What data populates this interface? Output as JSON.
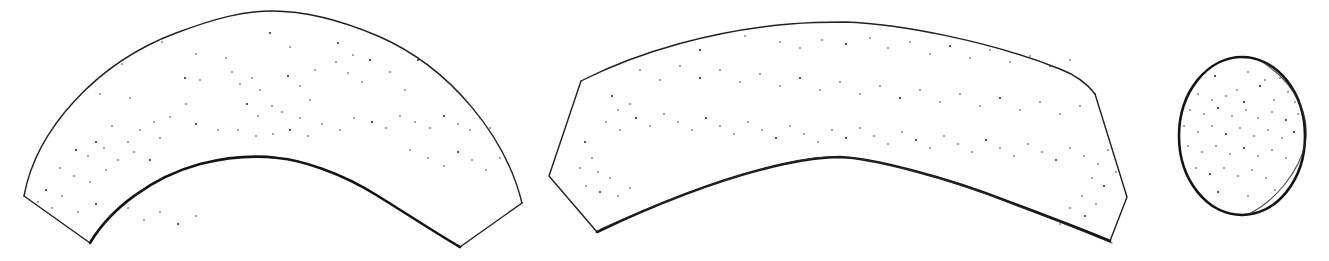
{
  "figure": {
    "background_color": "#ffffff",
    "outline_color": "#1f1f1f",
    "heavy_outline_color": "#141414",
    "dot_color": "#4a4a4a",
    "canvas": {
      "width": 1329,
      "height": 261
    },
    "shape_count": 3
  },
  "shapes": [
    {
      "id": "crescent-left",
      "label": "Left curved band",
      "kind": "crescent-band",
      "bbox": {
        "x": 22,
        "y": 8,
        "width": 502,
        "height": 242
      },
      "outer_arc_apex": {
        "x": 272,
        "y": 11
      },
      "inner_arc_apex": {
        "x": 278,
        "y": 158
      },
      "corners": [
        {
          "x": 24,
          "y": 196
        },
        {
          "x": 90,
          "y": 243
        },
        {
          "x": 460,
          "y": 247
        },
        {
          "x": 522,
          "y": 203
        }
      ],
      "outer_path": "M24,196 C36,130 96,63 176,33 C216,18 244,11 272,11 C302,11 338,19 378,36 C452,68 506,138 522,203",
      "inner_path": "M90,243 C110,209 152,177 200,164 C236,155 262,156 278,158 C300,160 340,172 378,196 C418,221 444,238 460,247",
      "end_cap_left": "M24,196 L90,243",
      "end_cap_right": "M460,247 L522,203",
      "dot_count": 88
    },
    {
      "id": "crescent-right",
      "label": "Right curved band",
      "kind": "crescent-band",
      "bbox": {
        "x": 548,
        "y": 20,
        "width": 580,
        "height": 224
      },
      "outer_arc_apex": {
        "x": 845,
        "y": 22
      },
      "inner_arc_apex": {
        "x": 840,
        "y": 157
      },
      "corners": [
        {
          "x": 581,
          "y": 81
        },
        {
          "x": 549,
          "y": 176
        },
        {
          "x": 597,
          "y": 232
        },
        {
          "x": 1110,
          "y": 241
        },
        {
          "x": 1127,
          "y": 197
        },
        {
          "x": 1095,
          "y": 94
        }
      ],
      "outer_path": "M581,81 C640,51 716,30 790,24 C812,22 832,22 845,22 C902,24 992,42 1060,69 C1078,76 1089,86 1095,94",
      "inner_path": "M597,232 C654,205 720,178 784,164 C812,158 830,157 840,157 C870,158 944,176 1012,203 C1060,221 1098,236 1110,241",
      "inner_path_ghost": "M601,229 C658,203 724,177 788,163 C816,157 834,156 844,157 C874,159 948,178 1016,205 C1064,223 1100,238 1112,243",
      "end_cap_left": "M581,81 L549,176 L597,232",
      "end_cap_right": "M1095,94 L1127,197 L1110,241",
      "dot_count": 96
    },
    {
      "id": "circle-right",
      "label": "Circle",
      "kind": "circle",
      "bbox": {
        "x": 1179,
        "y": 57,
        "width": 128,
        "height": 158
      },
      "center": {
        "x": 1242,
        "y": 136
      },
      "radius_x": 63,
      "radius_y": 79,
      "has_double_stroke_right": true,
      "dot_count": 45
    }
  ],
  "stipple": {
    "crescent_left": [
      [
        270,
        33
      ],
      [
        162,
        42
      ],
      [
        196,
        54
      ],
      [
        226,
        58
      ],
      [
        290,
        47
      ],
      [
        338,
        43
      ],
      [
        315,
        70
      ],
      [
        122,
        64
      ],
      [
        100,
        94
      ],
      [
        130,
        98
      ],
      [
        185,
        78
      ],
      [
        200,
        80
      ],
      [
        232,
        72
      ],
      [
        240,
        84
      ],
      [
        252,
        78
      ],
      [
        288,
        76
      ],
      [
        260,
        90
      ],
      [
        300,
        86
      ],
      [
        336,
        62
      ],
      [
        353,
        55
      ],
      [
        370,
        60
      ],
      [
        348,
        73
      ],
      [
        362,
        82
      ],
      [
        390,
        72
      ],
      [
        405,
        90
      ],
      [
        418,
        60
      ],
      [
        310,
        100
      ],
      [
        272,
        106
      ],
      [
        282,
        112
      ],
      [
        300,
        118
      ],
      [
        247,
        104
      ],
      [
        258,
        116
      ],
      [
        186,
        104
      ],
      [
        170,
        117
      ],
      [
        154,
        122
      ],
      [
        196,
        124
      ],
      [
        140,
        130
      ],
      [
        160,
        138
      ],
      [
        112,
        126
      ],
      [
        128,
        142
      ],
      [
        96,
        142
      ],
      [
        218,
        130
      ],
      [
        238,
        130
      ],
      [
        256,
        136
      ],
      [
        273,
        134
      ],
      [
        290,
        130
      ],
      [
        308,
        136
      ],
      [
        322,
        124
      ],
      [
        340,
        130
      ],
      [
        354,
        118
      ],
      [
        372,
        122
      ],
      [
        386,
        128
      ],
      [
        400,
        116
      ],
      [
        415,
        122
      ],
      [
        430,
        128
      ],
      [
        444,
        116
      ],
      [
        458,
        124
      ],
      [
        470,
        130
      ],
      [
        480,
        118
      ],
      [
        490,
        128
      ],
      [
        76,
        150
      ],
      [
        88,
        156
      ],
      [
        104,
        148
      ],
      [
        118,
        160
      ],
      [
        134,
        152
      ],
      [
        150,
        160
      ],
      [
        60,
        168
      ],
      [
        74,
        176
      ],
      [
        90,
        182
      ],
      [
        106,
        170
      ],
      [
        46,
        190
      ],
      [
        62,
        196
      ],
      [
        38,
        202
      ],
      [
        52,
        208
      ],
      [
        78,
        212
      ],
      [
        96,
        204
      ],
      [
        110,
        216
      ],
      [
        128,
        208
      ],
      [
        144,
        220
      ],
      [
        160,
        212
      ],
      [
        178,
        224
      ],
      [
        196,
        216
      ],
      [
        410,
        150
      ],
      [
        428,
        158
      ],
      [
        444,
        166
      ],
      [
        458,
        152
      ],
      [
        472,
        160
      ],
      [
        486,
        170
      ],
      [
        500,
        158
      ]
    ],
    "crescent_right": [
      [
        700,
        50
      ],
      [
        745,
        36
      ],
      [
        780,
        42
      ],
      [
        800,
        48
      ],
      [
        822,
        40
      ],
      [
        846,
        44
      ],
      [
        870,
        38
      ],
      [
        888,
        48
      ],
      [
        910,
        42
      ],
      [
        930,
        54
      ],
      [
        950,
        46
      ],
      [
        970,
        58
      ],
      [
        990,
        50
      ],
      [
        1010,
        62
      ],
      [
        1030,
        56
      ],
      [
        1050,
        66
      ],
      [
        1070,
        60
      ],
      [
        640,
        70
      ],
      [
        660,
        80
      ],
      [
        680,
        66
      ],
      [
        700,
        78
      ],
      [
        720,
        70
      ],
      [
        740,
        82
      ],
      [
        760,
        74
      ],
      [
        780,
        86
      ],
      [
        800,
        78
      ],
      [
        820,
        90
      ],
      [
        840,
        82
      ],
      [
        860,
        94
      ],
      [
        880,
        86
      ],
      [
        900,
        98
      ],
      [
        920,
        90
      ],
      [
        940,
        102
      ],
      [
        960,
        94
      ],
      [
        980,
        106
      ],
      [
        1000,
        98
      ],
      [
        1020,
        110
      ],
      [
        1040,
        102
      ],
      [
        1060,
        114
      ],
      [
        1080,
        106
      ],
      [
        612,
        96
      ],
      [
        618,
        110
      ],
      [
        630,
        104
      ],
      [
        606,
        122
      ],
      [
        620,
        130
      ],
      [
        636,
        118
      ],
      [
        650,
        126
      ],
      [
        664,
        114
      ],
      [
        678,
        122
      ],
      [
        692,
        130
      ],
      [
        706,
        118
      ],
      [
        720,
        126
      ],
      [
        734,
        134
      ],
      [
        748,
        122
      ],
      [
        762,
        130
      ],
      [
        776,
        138
      ],
      [
        790,
        126
      ],
      [
        804,
        134
      ],
      [
        818,
        142
      ],
      [
        832,
        130
      ],
      [
        846,
        138
      ],
      [
        860,
        128
      ],
      [
        874,
        136
      ],
      [
        888,
        144
      ],
      [
        902,
        132
      ],
      [
        916,
        140
      ],
      [
        930,
        148
      ],
      [
        944,
        136
      ],
      [
        958,
        144
      ],
      [
        972,
        152
      ],
      [
        986,
        140
      ],
      [
        1000,
        148
      ],
      [
        1014,
        156
      ],
      [
        1028,
        144
      ],
      [
        1042,
        152
      ],
      [
        1056,
        160
      ],
      [
        1070,
        148
      ],
      [
        1084,
        156
      ],
      [
        1098,
        164
      ],
      [
        1108,
        150
      ],
      [
        585,
        142
      ],
      [
        592,
        158
      ],
      [
        580,
        168
      ],
      [
        598,
        172
      ],
      [
        586,
        186
      ],
      [
        600,
        192
      ],
      [
        610,
        178
      ],
      [
        618,
        196
      ],
      [
        630,
        188
      ],
      [
        1092,
        178
      ],
      [
        1104,
        186
      ],
      [
        1116,
        172
      ],
      [
        1082,
        196
      ],
      [
        1096,
        204
      ],
      [
        1070,
        208
      ],
      [
        1085,
        216
      ],
      [
        1060,
        224
      ]
    ],
    "circle": [
      [
        1215,
        76
      ],
      [
        1248,
        72
      ],
      [
        1265,
        80
      ],
      [
        1280,
        78
      ],
      [
        1237,
        90
      ],
      [
        1260,
        86
      ],
      [
        1288,
        92
      ],
      [
        1198,
        94
      ],
      [
        1212,
        100
      ],
      [
        1226,
        96
      ],
      [
        1244,
        102
      ],
      [
        1274,
        100
      ],
      [
        1295,
        102
      ],
      [
        1190,
        110
      ],
      [
        1204,
        114
      ],
      [
        1218,
        108
      ],
      [
        1232,
        116
      ],
      [
        1246,
        110
      ],
      [
        1258,
        118
      ],
      [
        1272,
        112
      ],
      [
        1286,
        120
      ],
      [
        1298,
        114
      ],
      [
        1184,
        126
      ],
      [
        1198,
        132
      ],
      [
        1212,
        126
      ],
      [
        1226,
        134
      ],
      [
        1240,
        128
      ],
      [
        1254,
        136
      ],
      [
        1268,
        130
      ],
      [
        1282,
        138
      ],
      [
        1294,
        132
      ],
      [
        1188,
        146
      ],
      [
        1202,
        152
      ],
      [
        1216,
        146
      ],
      [
        1230,
        154
      ],
      [
        1244,
        148
      ],
      [
        1258,
        156
      ],
      [
        1272,
        150
      ],
      [
        1286,
        158
      ],
      [
        1196,
        168
      ],
      [
        1210,
        174
      ],
      [
        1224,
        168
      ],
      [
        1238,
        176
      ],
      [
        1252,
        170
      ],
      [
        1266,
        178
      ],
      [
        1218,
        192
      ],
      [
        1248,
        196
      ],
      [
        1275,
        190
      ]
    ]
  }
}
